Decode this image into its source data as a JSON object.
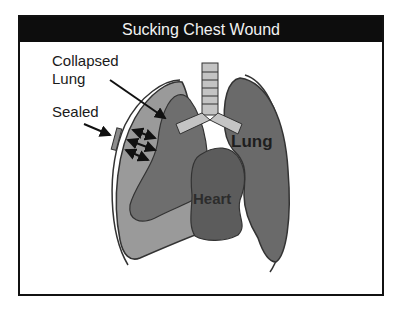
{
  "slide": {
    "title": "Sucking Chest Wound"
  },
  "labels": {
    "collapsed_lung_line1": "Collapsed",
    "collapsed_lung_line2": "Lung",
    "sealed": "Sealed",
    "lung": "Lung",
    "heart": "Heart"
  },
  "colors": {
    "title_bg": "#0d0d0d",
    "title_text": "#f2f2f2",
    "collapsed_lung_outer": "#9a9a9a",
    "collapsed_lung_inner": "#6e6e6e",
    "healthy_lung": "#6a6a6a",
    "heart": "#5c5c5c",
    "trachea": "#c4c4c4",
    "outline": "#333333"
  }
}
